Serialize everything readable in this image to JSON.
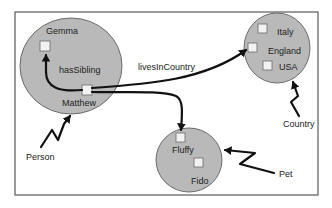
{
  "diagram": {
    "colors": {
      "background": "#ffffff",
      "frame": "#5a5a5a",
      "set_fill": "#b9b9b9",
      "node_fill": "#f2f2f2",
      "edge": "#111111"
    },
    "sets": {
      "person": {
        "class_label": "Person",
        "members": [
          "Gemma",
          "Matthew"
        ]
      },
      "country": {
        "class_label": "Country",
        "members": [
          "Italy",
          "England",
          "USA"
        ]
      },
      "pet": {
        "class_label": "Pet",
        "members": [
          "Fluffy",
          "Fido"
        ]
      }
    },
    "nodes": {
      "gemma": "Gemma",
      "matthew": "Matthew",
      "italy": "Italy",
      "england": "England",
      "usa": "USA",
      "fluffy": "Fluffy",
      "fido": "Fido"
    },
    "edges": {
      "has_sibling": {
        "label": "hasSibling",
        "from": "Matthew",
        "to": "Gemma"
      },
      "lives_in_country": {
        "label": "livesInCountry",
        "from": "Matthew",
        "to": "England"
      },
      "has_pet": {
        "label": "",
        "from": "Matthew",
        "to": "Fluffy"
      }
    },
    "class_labels": {
      "person": "Person",
      "country": "Country",
      "pet": "Pet"
    }
  }
}
